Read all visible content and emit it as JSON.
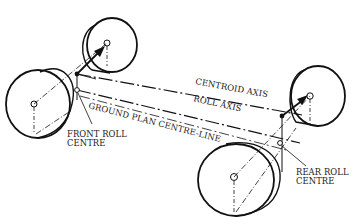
{
  "diagram": {
    "type": "vehicle roll axis schematic",
    "labels": {
      "centroid_axis": "CENTROID AXIS",
      "roll_axis": "ROLL AXIS",
      "ground_plan": "GROUND PLAN CENTRE-LINE",
      "front_roll_1": "FRONT ROLL",
      "front_roll_2": "CENTRE",
      "rear_roll_1": "REAR ROLL",
      "rear_roll_2": "CENTRE"
    },
    "colors": {
      "ink": "#111111",
      "background": "#ffffff"
    }
  }
}
